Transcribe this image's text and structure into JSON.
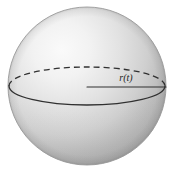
{
  "figure": {
    "name": "sphere-with-radius",
    "kind": "3d-geometry-illustration",
    "background_color": "#ffffff",
    "title": "",
    "caption": ""
  },
  "sphere": {
    "name": "sphere",
    "center_x": 87,
    "center_y": 86,
    "radius": 79,
    "fill_light": "#f7f7f7",
    "fill_mid": "#d6d6d6",
    "fill_dark": "#a8a8a8",
    "fill_edge": "#9a9a9a",
    "outline_color": "#8f8f8f",
    "highlight_x": 46,
    "highlight_y": 40
  },
  "equator": {
    "name": "equator-ellipse",
    "center_x": 87,
    "center_y": 86,
    "semi_major": 78,
    "semi_minor": 19,
    "stroke_color": "#303030",
    "stroke_width": 1.3,
    "front_style": "solid",
    "back_style": "dashed",
    "dash_pattern": "6 4"
  },
  "radius_line": {
    "name": "radius-line",
    "x1": 87,
    "y1": 87,
    "x2": 166,
    "y2": 87,
    "stroke_color": "#303030",
    "stroke_width": 1.1
  },
  "labels": {
    "radius": {
      "name": "radius-label",
      "text": "r(t)",
      "x": 126,
      "y": 81,
      "font_style": "italic",
      "font_size": 10,
      "color": "#1d1d1d"
    }
  }
}
